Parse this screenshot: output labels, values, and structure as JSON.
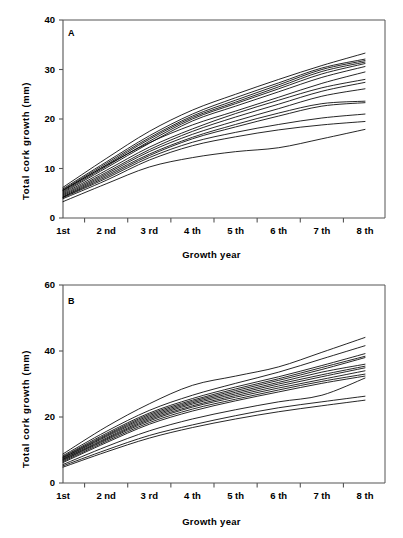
{
  "figure": {
    "background": "#ffffff",
    "line_color": "#000000",
    "axis_color": "#555555"
  },
  "chart_data": [
    {
      "type": "line",
      "panel_label": "A",
      "title": "",
      "xlabel": "Growth year",
      "ylabel": "Total cork growth (mm)",
      "categories": [
        "1st",
        "2 nd",
        "3 rd",
        "4 th",
        "5 th",
        "6 th",
        "7 th",
        "8 th"
      ],
      "x": [
        1,
        2,
        3,
        4,
        5,
        6,
        7,
        8
      ],
      "ylim": [
        0,
        40
      ],
      "yticks": [
        0,
        10,
        20,
        30,
        40
      ],
      "grid": false,
      "legend": "none",
      "series": [
        {
          "name": "tree-01",
          "values": [
            6.2,
            12.0,
            17.5,
            21.8,
            25.0,
            28.0,
            30.8,
            33.3
          ]
        },
        {
          "name": "tree-02",
          "values": [
            5.9,
            11.3,
            16.6,
            21.0,
            24.3,
            27.3,
            30.3,
            32.1
          ]
        },
        {
          "name": "tree-03",
          "values": [
            5.7,
            11.0,
            16.2,
            20.6,
            23.8,
            26.9,
            30.0,
            31.8
          ]
        },
        {
          "name": "tree-04",
          "values": [
            5.5,
            10.7,
            15.9,
            20.3,
            23.4,
            26.5,
            29.6,
            31.5
          ]
        },
        {
          "name": "tree-05",
          "values": [
            5.3,
            10.4,
            15.5,
            20.0,
            23.1,
            26.1,
            29.1,
            31.2
          ]
        },
        {
          "name": "tree-06",
          "values": [
            5.1,
            10.1,
            15.1,
            19.6,
            22.6,
            25.5,
            28.4,
            30.6
          ]
        },
        {
          "name": "tree-07",
          "values": [
            5.6,
            10.6,
            15.2,
            18.8,
            21.6,
            24.4,
            27.2,
            29.5
          ]
        },
        {
          "name": "tree-08",
          "values": [
            4.9,
            9.6,
            14.3,
            18.0,
            21.1,
            23.8,
            26.3,
            28.0
          ]
        },
        {
          "name": "tree-09",
          "values": [
            4.7,
            9.2,
            13.8,
            17.5,
            20.4,
            23.0,
            25.6,
            27.4
          ]
        },
        {
          "name": "tree-10",
          "values": [
            4.5,
            8.9,
            13.4,
            16.9,
            19.6,
            22.1,
            24.6,
            26.1
          ]
        },
        {
          "name": "tree-11",
          "values": [
            4.3,
            8.6,
            12.9,
            16.3,
            18.9,
            21.2,
            23.1,
            23.6
          ]
        },
        {
          "name": "tree-12",
          "values": [
            4.2,
            8.3,
            12.6,
            16.0,
            18.4,
            20.6,
            22.6,
            23.3
          ]
        },
        {
          "name": "tree-13",
          "values": [
            4.1,
            8.0,
            12.2,
            15.3,
            17.3,
            18.9,
            20.2,
            21.0
          ]
        },
        {
          "name": "tree-14",
          "values": [
            3.9,
            7.6,
            11.7,
            14.6,
            16.4,
            17.8,
            18.8,
            19.5
          ]
        },
        {
          "name": "tree-15",
          "values": [
            3.3,
            6.9,
            10.3,
            12.2,
            13.4,
            14.2,
            16.0,
            17.9
          ]
        }
      ]
    },
    {
      "type": "line",
      "panel_label": "B",
      "title": "",
      "xlabel": "Growth year",
      "ylabel": "Total cork growth (mm)",
      "categories": [
        "1st",
        "2 nd",
        "3 rd",
        "4 th",
        "5 th",
        "6 th",
        "7 th",
        "8 th"
      ],
      "x": [
        1,
        2,
        3,
        4,
        5,
        6,
        7,
        8
      ],
      "ylim": [
        0,
        60
      ],
      "yticks": [
        0,
        20,
        40,
        60
      ],
      "grid": false,
      "legend": "none",
      "series": [
        {
          "name": "tree-01",
          "values": [
            8.8,
            17.0,
            24.0,
            29.6,
            32.4,
            35.2,
            39.6,
            44.1
          ]
        },
        {
          "name": "tree-02",
          "values": [
            8.3,
            15.6,
            22.0,
            26.6,
            30.2,
            33.6,
            37.6,
            41.6
          ]
        },
        {
          "name": "tree-03",
          "values": [
            8.0,
            15.0,
            21.2,
            25.6,
            29.1,
            32.2,
            35.6,
            39.2
          ]
        },
        {
          "name": "tree-04",
          "values": [
            7.8,
            14.6,
            20.8,
            25.1,
            28.5,
            31.6,
            35.0,
            38.4
          ]
        },
        {
          "name": "tree-05",
          "values": [
            7.6,
            14.3,
            20.4,
            24.7,
            28.0,
            31.1,
            34.4,
            38.0
          ]
        },
        {
          "name": "tree-06",
          "values": [
            7.4,
            14.0,
            20.0,
            24.3,
            27.5,
            30.5,
            33.6,
            36.0
          ]
        },
        {
          "name": "tree-07",
          "values": [
            7.2,
            13.6,
            19.6,
            23.9,
            27.0,
            30.0,
            32.8,
            35.4
          ]
        },
        {
          "name": "tree-08",
          "values": [
            7.0,
            13.3,
            19.2,
            23.4,
            26.5,
            29.4,
            32.2,
            34.9
          ]
        },
        {
          "name": "tree-09",
          "values": [
            6.8,
            13.0,
            18.8,
            23.0,
            26.0,
            28.8,
            31.4,
            34.0
          ]
        },
        {
          "name": "tree-10",
          "values": [
            6.5,
            12.6,
            18.3,
            22.4,
            25.4,
            28.2,
            30.8,
            33.0
          ]
        },
        {
          "name": "tree-11",
          "values": [
            6.2,
            12.2,
            17.8,
            21.8,
            24.9,
            27.6,
            30.2,
            32.4
          ]
        },
        {
          "name": "tree-12",
          "values": [
            5.6,
            11.0,
            15.8,
            19.4,
            22.2,
            24.6,
            26.6,
            31.8
          ]
        },
        {
          "name": "tree-13",
          "values": [
            5.2,
            10.0,
            14.4,
            17.6,
            20.4,
            22.8,
            24.6,
            26.3
          ]
        },
        {
          "name": "tree-14",
          "values": [
            4.8,
            9.4,
            13.6,
            16.8,
            19.4,
            21.6,
            23.4,
            25.1
          ]
        }
      ]
    }
  ]
}
